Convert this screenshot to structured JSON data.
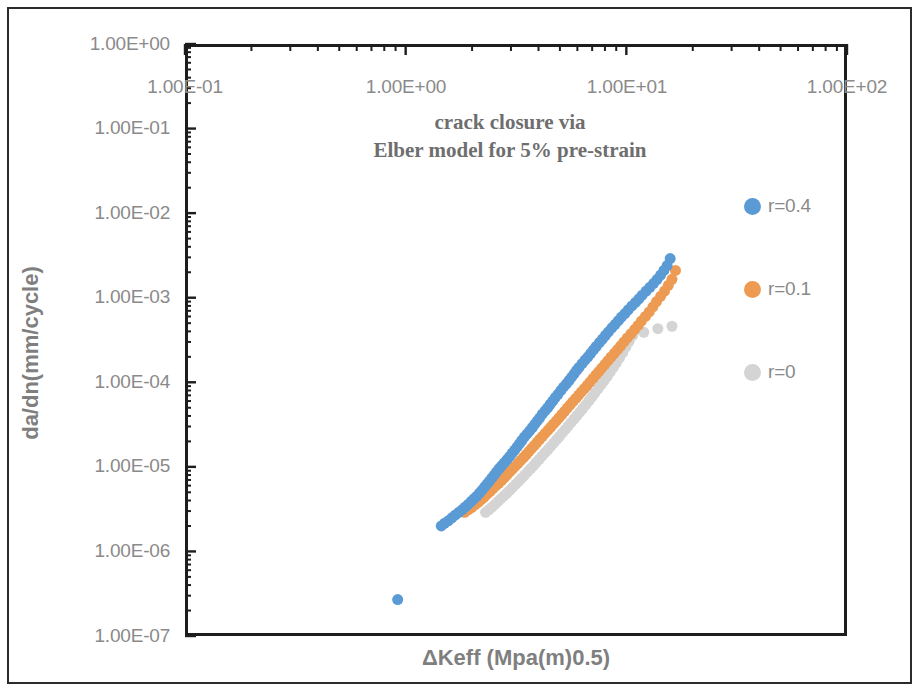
{
  "chart_data": {
    "type": "scatter",
    "title": "crack closure via Elber model for 5% pre-strain",
    "title_lines": [
      "crack closure via",
      "Elber model for 5% pre-strain"
    ],
    "xlabel": "ΔKeff (Mpa(m)0.5)",
    "ylabel": "da/dn(mm/cycle)",
    "xscale": "log",
    "yscale": "log",
    "xlim": [
      0.1,
      100
    ],
    "ylim": [
      1e-07,
      1
    ],
    "grid": false,
    "legend_position": "right",
    "xticks": [
      "1.00E-01",
      "1.00E+00",
      "1.00E+01",
      "1.00E+02"
    ],
    "xtick_values": [
      0.1,
      1,
      10,
      100
    ],
    "yticks": [
      "1.00E+00",
      "1.00E-01",
      "1.00E-02",
      "1.00E-03",
      "1.00E-04",
      "1.00E-05",
      "1.00E-06",
      "1.00E-07"
    ],
    "ytick_values": [
      1,
      0.1,
      0.01,
      0.001,
      0.0001,
      1e-05,
      1e-06,
      1e-07
    ],
    "marker": "circle",
    "marker_size": 11,
    "series": [
      {
        "name": "r=0.4",
        "color": "#5B9BD5",
        "x": [
          1.45,
          1.5,
          1.56,
          1.62,
          1.68,
          1.74,
          1.8,
          1.86,
          1.92,
          1.98,
          2.04,
          2.1,
          2.16,
          2.22,
          2.28,
          2.34,
          2.4,
          2.46,
          2.52,
          2.58,
          2.65,
          2.72,
          2.8,
          2.88,
          2.96,
          3.04,
          3.12,
          3.2,
          3.28,
          3.36,
          3.45,
          3.55,
          3.65,
          3.75,
          3.85,
          3.95,
          4.05,
          4.16,
          4.28,
          4.4,
          4.52,
          4.64,
          4.76,
          4.9,
          5.05,
          5.2,
          5.35,
          5.5,
          5.65,
          5.8,
          5.95,
          6.1,
          6.3,
          6.5,
          6.7,
          6.9,
          7.1,
          7.3,
          7.55,
          7.8,
          8.05,
          8.3,
          8.6,
          8.9,
          9.2,
          9.5,
          9.85,
          10.2,
          10.6,
          11.0,
          11.4,
          11.8,
          12.3,
          12.8,
          13.3,
          13.8,
          14.3,
          14.8,
          15.3,
          15.8
        ],
        "y": [
          2e-06,
          2.15e-06,
          2.3e-06,
          2.5e-06,
          2.7e-06,
          2.9e-06,
          3.1e-06,
          3.35e-06,
          3.6e-06,
          3.9e-06,
          4.2e-06,
          4.5e-06,
          4.9e-06,
          5.3e-06,
          5.8e-06,
          6.3e-06,
          6.8e-06,
          7.4e-06,
          8e-06,
          8.7e-06,
          9.5e-06,
          1.03e-05,
          1.12e-05,
          1.22e-05,
          1.33e-05,
          1.45e-05,
          1.58e-05,
          1.72e-05,
          1.88e-05,
          2.05e-05,
          2.25e-05,
          2.45e-05,
          2.68e-05,
          2.92e-05,
          3.2e-05,
          3.5e-05,
          3.8e-05,
          4.2e-05,
          4.6e-05,
          5e-05,
          5.5e-05,
          6e-05,
          6.6e-05,
          7.2e-05,
          8e-05,
          8.8e-05,
          9.6e-05,
          0.000105,
          0.000115,
          0.000126,
          0.000138,
          0.00015,
          0.000166,
          0.000183,
          0.0002,
          0.00022,
          0.000242,
          0.000265,
          0.000295,
          0.000325,
          0.00036,
          0.000395,
          0.00044,
          0.000485,
          0.000535,
          0.00059,
          0.00065,
          0.00072,
          0.0008,
          0.00088,
          0.00097,
          0.00107,
          0.0012,
          0.00133,
          0.00148,
          0.00165,
          0.00185,
          0.0021,
          0.0024,
          0.0029
        ],
        "outliers": [
          {
            "x": 0.92,
            "y": 2.7e-07
          }
        ]
      },
      {
        "name": "r=0.1",
        "color": "#ED9B52",
        "x": [
          1.85,
          1.92,
          1.99,
          2.06,
          2.13,
          2.2,
          2.27,
          2.34,
          2.41,
          2.48,
          2.56,
          2.64,
          2.72,
          2.8,
          2.88,
          2.96,
          3.05,
          3.14,
          3.23,
          3.32,
          3.42,
          3.52,
          3.62,
          3.72,
          3.83,
          3.94,
          4.05,
          4.17,
          4.29,
          4.42,
          4.55,
          4.68,
          4.82,
          4.96,
          5.1,
          5.25,
          5.4,
          5.56,
          5.72,
          5.9,
          6.08,
          6.26,
          6.45,
          6.65,
          6.85,
          7.06,
          7.28,
          7.5,
          7.75,
          8.0,
          8.26,
          8.53,
          8.82,
          9.12,
          9.43,
          9.75,
          10.1,
          10.5,
          10.9,
          11.3,
          11.7,
          12.2,
          12.7,
          13.2,
          13.7,
          14.3,
          14.9,
          15.5,
          16.1,
          16.7
        ],
        "y": [
          2.9e-06,
          3.1e-06,
          3.3e-06,
          3.55e-06,
          3.8e-06,
          4.1e-06,
          4.4e-06,
          4.75e-06,
          5.1e-06,
          5.5e-06,
          5.95e-06,
          6.4e-06,
          6.9e-06,
          7.45e-06,
          8.05e-06,
          8.7e-06,
          9.4e-06,
          1.02e-05,
          1.1e-05,
          1.19e-05,
          1.29e-05,
          1.4e-05,
          1.52e-05,
          1.65e-05,
          1.79e-05,
          1.95e-05,
          2.12e-05,
          2.3e-05,
          2.5e-05,
          2.72e-05,
          2.96e-05,
          3.22e-05,
          3.5e-05,
          3.82e-05,
          4.16e-05,
          4.54e-05,
          4.95e-05,
          5.4e-05,
          5.9e-05,
          6.45e-05,
          7.05e-05,
          7.7e-05,
          8.4e-05,
          9.2e-05,
          0.000101,
          0.000111,
          0.000122,
          0.000134,
          0.000148,
          0.000163,
          0.00018,
          0.000199,
          0.00022,
          0.000244,
          0.00027,
          0.0003,
          0.000335,
          0.000375,
          0.00042,
          0.00047,
          0.00053,
          0.0006,
          0.00068,
          0.00078,
          0.0009,
          0.00104,
          0.0012,
          0.0014,
          0.00165,
          0.0021
        ]
      },
      {
        "name": "r=0",
        "color": "#D4D4D4",
        "x": [
          2.3,
          2.38,
          2.46,
          2.54,
          2.62,
          2.7,
          2.79,
          2.88,
          2.97,
          3.06,
          3.16,
          3.26,
          3.36,
          3.46,
          3.57,
          3.68,
          3.79,
          3.91,
          4.03,
          4.15,
          4.28,
          4.41,
          4.55,
          4.69,
          4.83,
          4.98,
          5.13,
          5.29,
          5.45,
          5.62,
          5.8,
          5.98,
          6.17,
          6.36,
          6.56,
          6.77,
          6.98,
          7.2,
          7.43,
          7.67,
          7.92,
          8.18,
          8.45,
          8.73,
          9.02,
          9.32,
          9.63,
          9.95,
          10.3,
          10.7
        ],
        "y": [
          2.9e-06,
          3.1e-06,
          3.35e-06,
          3.6e-06,
          3.9e-06,
          4.2e-06,
          4.55e-06,
          4.9e-06,
          5.3e-06,
          5.75e-06,
          6.25e-06,
          6.8e-06,
          7.4e-06,
          8e-06,
          8.7e-06,
          9.5e-06,
          1.03e-05,
          1.13e-05,
          1.23e-05,
          1.34e-05,
          1.47e-05,
          1.6e-05,
          1.75e-05,
          1.92e-05,
          2.1e-05,
          2.3e-05,
          2.52e-05,
          2.77e-05,
          3.04e-05,
          3.35e-05,
          3.68e-05,
          4.05e-05,
          4.47e-05,
          4.93e-05,
          5.45e-05,
          6.05e-05,
          6.7e-05,
          7.45e-05,
          8.3e-05,
          9.3e-05,
          0.000104,
          0.000117,
          0.000132,
          0.00015,
          0.00017,
          0.000195,
          0.000225,
          0.00026,
          0.000305,
          0.00036
        ],
        "outliers": [
          {
            "x": 12.0,
            "y": 0.00039
          },
          {
            "x": 13.9,
            "y": 0.00043
          },
          {
            "x": 16.1,
            "y": 0.00046
          }
        ]
      }
    ]
  },
  "legend": {
    "items": [
      {
        "label": "r=0.4",
        "color": "#5B9BD5"
      },
      {
        "label": "r=0.1",
        "color": "#ED9B52"
      },
      {
        "label": "r=0",
        "color": "#D4D4D4"
      }
    ]
  },
  "axes": {
    "x_title": "ΔKeff (Mpa(m)0.5)",
    "y_title": "da/dn(mm/cycle)",
    "x_tick_labels": [
      "1.00E-01",
      "1.00E+00",
      "1.00E+01",
      "1.00E+02"
    ],
    "y_tick_labels": [
      "1.00E+00",
      "1.00E-01",
      "1.00E-02",
      "1.00E-03",
      "1.00E-04",
      "1.00E-05",
      "1.00E-06",
      "1.00E-07"
    ],
    "axis_color": "#1d1d1d",
    "tick_text_color": "#8a8a8a"
  },
  "title": {
    "line1": "crack closure via",
    "line2": "Elber model for 5% pre-strain",
    "color": "#6e6e6e"
  }
}
